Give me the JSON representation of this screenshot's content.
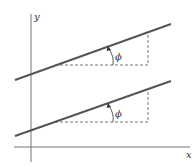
{
  "diagram": {
    "axes": {
      "x_label": "x",
      "y_label": "y"
    },
    "lines": [
      {
        "name": "upper-line",
        "angle_label": "ϕ"
      },
      {
        "name": "lower-line",
        "angle_label": "ϕ"
      }
    ],
    "colors": {
      "line": "#555555",
      "axis": "#777777",
      "dash": "#555555"
    }
  }
}
